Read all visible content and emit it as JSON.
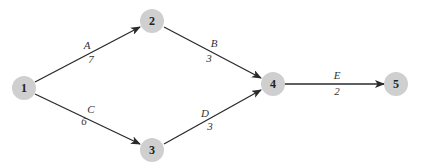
{
  "diagram": {
    "type": "activity-on-arrow network",
    "colors": {
      "node_fill": "#cfcfcf",
      "edge_stroke": "#2a2a2a",
      "text": "#222222"
    },
    "nodes": [
      {
        "id": "1",
        "label": "1",
        "x": 24,
        "y": 88
      },
      {
        "id": "2",
        "label": "2",
        "x": 152,
        "y": 21
      },
      {
        "id": "3",
        "label": "3",
        "x": 152,
        "y": 150
      },
      {
        "id": "4",
        "label": "4",
        "x": 273,
        "y": 84
      },
      {
        "id": "5",
        "label": "5",
        "x": 396,
        "y": 84
      }
    ],
    "edges": [
      {
        "from": "1",
        "to": "2",
        "name": "A",
        "weight": "7"
      },
      {
        "from": "2",
        "to": "4",
        "name": "B",
        "weight": "3"
      },
      {
        "from": "1",
        "to": "3",
        "name": "C",
        "weight": "6"
      },
      {
        "from": "3",
        "to": "4",
        "name": "D",
        "weight": "3"
      },
      {
        "from": "4",
        "to": "5",
        "name": "E",
        "weight": "2"
      }
    ]
  }
}
